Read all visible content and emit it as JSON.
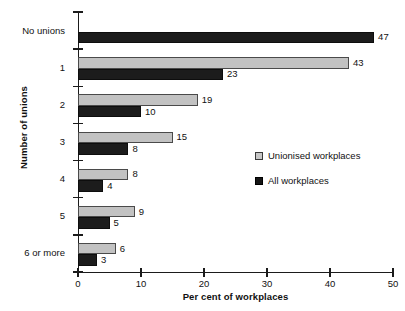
{
  "chart_data": {
    "type": "bar",
    "orientation": "horizontal",
    "title": "",
    "xlabel": "Per cent of workplaces",
    "ylabel": "Number of unions",
    "xlim": [
      0,
      50
    ],
    "xticks": [
      0,
      10,
      20,
      30,
      40,
      50
    ],
    "xtick_labels": [
      "0",
      "10",
      "20",
      "30",
      "40",
      "50"
    ],
    "grid": false,
    "legend_position": "center-right",
    "categories": [
      "No unions",
      "1",
      "2",
      "3",
      "4",
      "5",
      "6 or more"
    ],
    "series": [
      {
        "name": "Unionised workplaces",
        "color": "#c2c2c2",
        "values": [
          null,
          43,
          19,
          15,
          8,
          9,
          6
        ],
        "value_labels": [
          "",
          "43",
          "19",
          "15",
          "8",
          "9",
          "6"
        ]
      },
      {
        "name": "All workplaces",
        "color": "#1c1c1c",
        "values": [
          47,
          23,
          10,
          8,
          4,
          5,
          3
        ],
        "value_labels": [
          "47",
          "23",
          "10",
          "8",
          "4",
          "5",
          "3"
        ]
      }
    ]
  },
  "legend": {
    "items": [
      {
        "label": "Unionised workplaces",
        "swatch": "unionised"
      },
      {
        "label": "All workplaces",
        "swatch": "all"
      }
    ]
  }
}
